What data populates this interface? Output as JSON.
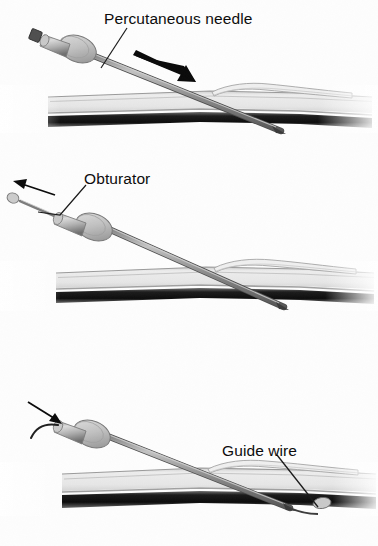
{
  "figure": {
    "background_color": "#fdfdfd",
    "width": 378,
    "height": 546,
    "panel_count": 3
  },
  "palette": {
    "ink": "#0b0b0b",
    "needle_light": "#b9b9b9",
    "needle_mid": "#8f8f8f",
    "needle_dark": "#5e5e5e",
    "hub_light": "#d6d6d6",
    "hub_mid": "#a8a8a8",
    "hub_dark": "#6e6e6e",
    "cap_dark": "#4a4a4a",
    "tissue_light": "#e3e3e3",
    "tissue_line": "#a0a0a0",
    "tissue_dark": "#141414",
    "arrow_black": "#0a0a0a"
  },
  "panels": [
    {
      "index": 1,
      "name": "percutaneous-needle-insertion",
      "label": "Percutaneous needle",
      "label_target": "needle-shaft",
      "arrow": {
        "name": "insertion-direction-arrow",
        "style": "thick-solid-black",
        "direction": "down-right",
        "meaning": "needle advanced into tissue"
      },
      "parts": [
        "needle-hub-cap",
        "needle-hub-barrel",
        "needle-flange-disc",
        "needle-shaft",
        "needle-bevel-tip",
        "tissue-superficial-layer",
        "tissue-deep-layer",
        "tissue-flap"
      ]
    },
    {
      "index": 2,
      "name": "obturator-withdrawal",
      "label": "Obturator",
      "label_target": "obturator-rod",
      "arrow": {
        "name": "obturator-withdrawal-arrow",
        "style": "thin-solid-black",
        "direction": "up-left",
        "meaning": "obturator withdrawn from needle"
      },
      "parts": [
        "obturator-knob",
        "obturator-rod",
        "needle-hub-barrel",
        "needle-flange-disc",
        "needle-shaft",
        "needle-bevel-tip",
        "tissue-superficial-layer",
        "tissue-deep-layer",
        "tissue-flap"
      ]
    },
    {
      "index": 3,
      "name": "guide-wire-insertion",
      "label": "Guide wire",
      "label_target": "guide-wire-tip",
      "arrow": {
        "name": "guide-wire-feed-arrow",
        "style": "thin-solid-black",
        "direction": "down-right",
        "meaning": "guide wire advanced through needle"
      },
      "parts": [
        "guide-wire-proximal-curve",
        "needle-hub-barrel",
        "needle-flange-disc",
        "needle-shaft",
        "needle-bevel-tip",
        "guide-wire-tip",
        "tissue-superficial-layer",
        "tissue-deep-layer",
        "tissue-flap"
      ]
    }
  ]
}
